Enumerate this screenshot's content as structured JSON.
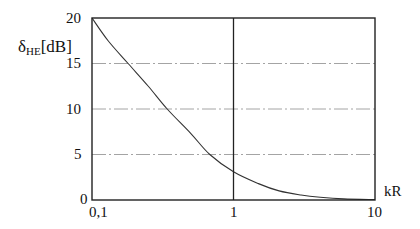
{
  "chart_data": {
    "type": "line",
    "title": "",
    "xlabel": "kR",
    "ylabel": "δHE [dB]",
    "ylabel_symbol": "δ",
    "ylabel_subscript": "HE",
    "ylabel_unit": "[dB]",
    "xscale": "log",
    "xlim": [
      0.1,
      10
    ],
    "ylim": [
      0,
      20
    ],
    "x_ticks": [
      "0,1",
      "1",
      "10"
    ],
    "y_ticks": [
      "0",
      "5",
      "10",
      "15",
      "20"
    ],
    "grid": {
      "horizontal": [
        5,
        10,
        15
      ],
      "vertical": [
        1
      ],
      "style": "dash-dot"
    },
    "series": [
      {
        "name": "δHE",
        "x": [
          0.1,
          0.13,
          0.18,
          0.25,
          0.34,
          0.5,
          0.68,
          1.0,
          1.5,
          2.1,
          3.0,
          4.1,
          6.0,
          10.0
        ],
        "values": [
          20,
          17.5,
          15,
          12.5,
          10,
          7.3,
          5,
          3.1,
          1.8,
          1.0,
          0.55,
          0.3,
          0.12,
          0.05
        ]
      }
    ]
  }
}
